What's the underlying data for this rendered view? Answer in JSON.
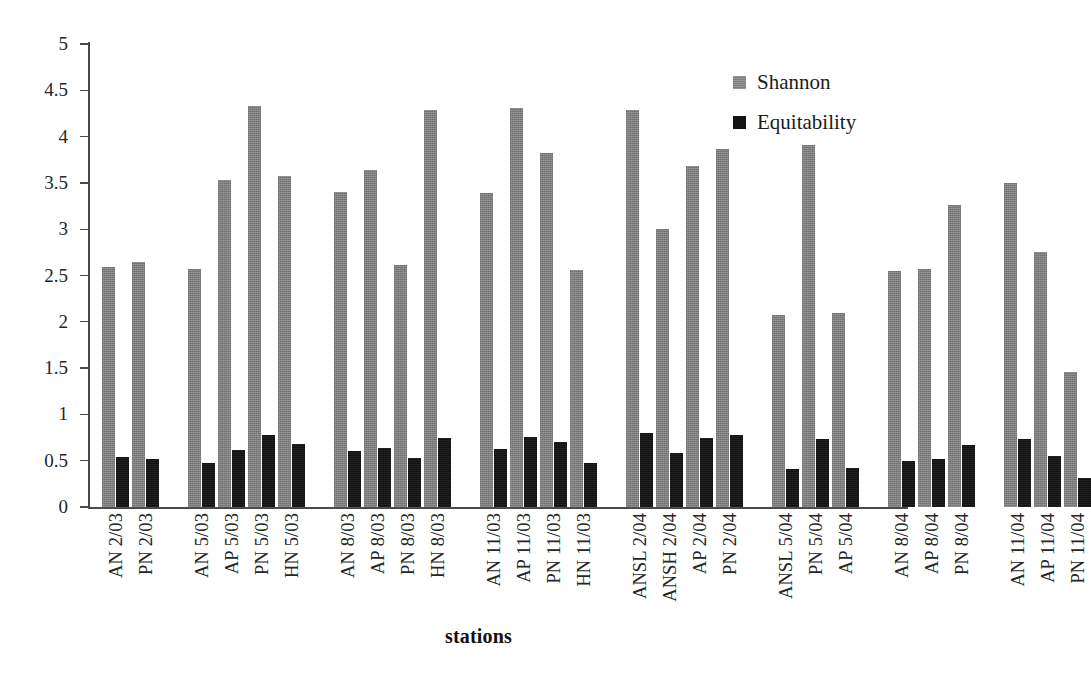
{
  "chart": {
    "type": "bar",
    "xlabel": "stations",
    "ylabel": "",
    "title": ""
  },
  "legend": {
    "position": "top-right",
    "entries": [
      {
        "label": "Shannon",
        "color": "#7d7d7d",
        "swatch": "shannon"
      },
      {
        "label": "Equitability",
        "color": "#141414",
        "swatch": "equitability"
      }
    ]
  },
  "yaxis": {
    "min": 0,
    "max": 5,
    "ticks": [
      "0",
      "0.5",
      "1",
      "1.5",
      "2",
      "2.5",
      "3",
      "3.5",
      "4",
      "4.5",
      "5"
    ],
    "tick_values": [
      0,
      0.5,
      1,
      1.5,
      2,
      2.5,
      3,
      3.5,
      4,
      4.5,
      5
    ]
  },
  "chart_data": {
    "type": "bar",
    "title": "",
    "xlabel": "stations",
    "ylabel": "",
    "ylim": [
      0,
      5
    ],
    "grid": false,
    "legend_position": "top-right",
    "categories": [
      "AN 2/03",
      "PN 2/03",
      "AN 5/03",
      "AP 5/03",
      "PN 5/03",
      "HN 5/03",
      "AN 8/03",
      "AP 8/03",
      "PN 8/03",
      "HN 8/03",
      "AN 11/03",
      "AP 11/03",
      "PN 11/03",
      "HN 11/03",
      "ANSL 2/04",
      "ANSH 2/04",
      "AP 2/04",
      "PN 2/04",
      "ANSL 5/04",
      "PN 5/04",
      "AP 5/04",
      "AN 8/04",
      "AP 8/04",
      "PN 8/04",
      "AN 11/04",
      "AP 11/04",
      "PN 11/04"
    ],
    "groups": [
      {
        "name": "2/03",
        "members": [
          "AN 2/03",
          "PN 2/03"
        ]
      },
      {
        "name": "5/03",
        "members": [
          "AN 5/03",
          "AP 5/03",
          "PN 5/03",
          "HN 5/03"
        ]
      },
      {
        "name": "8/03",
        "members": [
          "AN 8/03",
          "AP 8/03",
          "PN 8/03",
          "HN 8/03"
        ]
      },
      {
        "name": "11/03",
        "members": [
          "AN 11/03",
          "AP 11/03",
          "PN 11/03",
          "HN 11/03"
        ]
      },
      {
        "name": "2/04",
        "members": [
          "ANSL 2/04",
          "ANSH 2/04",
          "AP 2/04",
          "PN 2/04"
        ]
      },
      {
        "name": "5/04",
        "members": [
          "ANSL 5/04",
          "PN 5/04",
          "AP 5/04"
        ]
      },
      {
        "name": "8/04",
        "members": [
          "AN 8/04",
          "AP 8/04",
          "PN 8/04"
        ]
      },
      {
        "name": "11/04",
        "members": [
          "AN 11/04",
          "AP 11/04",
          "PN 11/04"
        ]
      }
    ],
    "series": [
      {
        "name": "Shannon",
        "color": "#7d7d7d",
        "values": [
          2.59,
          2.65,
          2.57,
          3.53,
          4.33,
          3.57,
          3.4,
          3.64,
          2.61,
          4.29,
          3.39,
          4.31,
          3.82,
          2.56,
          4.29,
          3.0,
          3.68,
          3.87,
          2.07,
          3.91,
          2.1,
          2.55,
          2.57,
          3.26,
          3.5,
          2.75,
          1.46
        ]
      },
      {
        "name": "Equitability",
        "color": "#141414",
        "values": [
          0.54,
          0.52,
          0.48,
          0.62,
          0.78,
          0.68,
          0.61,
          0.64,
          0.53,
          0.74,
          0.63,
          0.76,
          0.7,
          0.47,
          0.8,
          0.58,
          0.75,
          0.78,
          0.41,
          0.73,
          0.42,
          0.5,
          0.52,
          0.67,
          0.73,
          0.55,
          0.31
        ]
      }
    ]
  }
}
